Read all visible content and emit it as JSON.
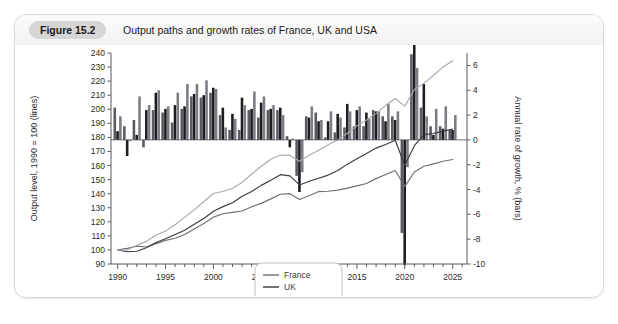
{
  "figure": {
    "badge": "Figure 15.2",
    "caption": "Output paths and growth rates of France, UK and USA"
  },
  "axes": {
    "left_title": "Output level, 1990 = 100 (lines)",
    "right_title": "Annual rate of growth, % (bars)",
    "left_ticks": [
      90,
      100,
      110,
      120,
      130,
      140,
      150,
      160,
      170,
      180,
      190,
      200,
      210,
      220,
      230,
      240
    ],
    "right_ticks": [
      -10,
      -8,
      -6,
      -4,
      -2,
      0,
      2,
      4,
      6
    ],
    "x_ticks": [
      1990,
      1995,
      2000,
      2005,
      2010,
      2015,
      2020,
      2025
    ]
  },
  "legend": {
    "items": [
      {
        "label": "France",
        "color": "#6f6f76"
      },
      {
        "label": "UK",
        "color": "#3a3a42"
      },
      {
        "label": "USA",
        "color": "#a9a9b0"
      }
    ]
  },
  "chart_data": {
    "type": "line",
    "title": "Output paths and growth rates of France, UK and USA",
    "xlabel": "",
    "ylabel": "Output level, 1990 = 100 (lines)",
    "y2label": "Annual rate of growth, % (bars)",
    "ylim": [
      90,
      240
    ],
    "y2lim": [
      -10,
      7
    ],
    "xlim": [
      1989.3,
      2026.5
    ],
    "grid": false,
    "legend_position": "inside-bottom-center",
    "x": [
      1990,
      1991,
      1992,
      1993,
      1994,
      1995,
      1996,
      1997,
      1998,
      1999,
      2000,
      2001,
      2002,
      2003,
      2004,
      2005,
      2006,
      2007,
      2008,
      2009,
      2010,
      2011,
      2012,
      2013,
      2014,
      2015,
      2016,
      2017,
      2018,
      2019,
      2020,
      2021,
      2022,
      2023,
      2024,
      2025
    ],
    "series": [
      {
        "name": "France",
        "kind": "line",
        "color": "#6f6f76",
        "axis": "left",
        "values": [
          100,
          101.1,
          102.7,
          102.1,
          104.5,
          106.8,
          108.3,
          111.0,
          114.9,
          118.8,
          123.3,
          125.7,
          126.7,
          127.7,
          130.7,
          133.1,
          136.3,
          139.6,
          140.0,
          135.9,
          138.5,
          141.5,
          141.7,
          142.5,
          143.9,
          145.5,
          147.2,
          150.7,
          153.6,
          156.5,
          145.2,
          155.4,
          159.5,
          161.2,
          163.0,
          164.3
        ]
      },
      {
        "name": "UK",
        "kind": "line",
        "color": "#3a3a42",
        "axis": "left",
        "values": [
          100,
          98.7,
          99.1,
          101.5,
          105.3,
          108.0,
          111.0,
          114.0,
          118.2,
          122.4,
          127.5,
          130.8,
          133.6,
          138.1,
          141.6,
          145.9,
          149.6,
          153.5,
          152.6,
          146.2,
          148.8,
          151.0,
          153.2,
          156.4,
          161.0,
          164.9,
          168.6,
          172.4,
          175.0,
          178.0,
          160.2,
          174.1,
          182.0,
          182.8,
          184.5,
          186.0
        ]
      },
      {
        "name": "USA",
        "kind": "line",
        "color": "#a9a9b0",
        "axis": "left",
        "values": [
          100,
          99.9,
          103.4,
          106.1,
          110.4,
          113.5,
          117.9,
          123.3,
          128.5,
          134.4,
          140.1,
          141.5,
          143.9,
          148.0,
          154.0,
          159.5,
          164.4,
          167.5,
          167.2,
          163.0,
          167.3,
          170.9,
          174.8,
          178.3,
          183.0,
          188.2,
          192.4,
          196.9,
          202.8,
          207.7,
          202.2,
          214.0,
          218.4,
          224.2,
          230.0,
          234.5
        ],
        "endpoint_level": 234
      },
      {
        "name": "France",
        "kind": "bar",
        "color": "#5a5a62",
        "axis": "right",
        "values": [
          2.6,
          1.1,
          1.6,
          -0.6,
          2.4,
          2.2,
          1.4,
          2.5,
          3.5,
          3.4,
          3.8,
          2.0,
          0.8,
          0.8,
          2.4,
          1.8,
          2.4,
          2.4,
          0.3,
          -2.9,
          1.9,
          2.2,
          0.2,
          0.6,
          1.0,
          1.1,
          1.1,
          2.4,
          1.9,
          1.9,
          -7.5,
          6.9,
          2.6,
          1.1,
          1.1,
          0.8
        ]
      },
      {
        "name": "UK",
        "kind": "bar",
        "color": "#1c1c22",
        "axis": "right",
        "values": [
          0.7,
          -1.3,
          0.4,
          2.4,
          3.8,
          2.5,
          2.8,
          2.7,
          3.7,
          3.6,
          4.2,
          2.6,
          2.1,
          3.4,
          2.5,
          3.0,
          2.5,
          2.6,
          -0.6,
          -4.2,
          1.8,
          1.5,
          1.5,
          2.1,
          2.9,
          2.4,
          2.2,
          2.3,
          1.5,
          1.6,
          -10.1,
          8.7,
          4.5,
          0.4,
          0.9,
          0.8
        ]
      },
      {
        "name": "USA",
        "kind": "bar",
        "color": "#7c7c84",
        "axis": "right",
        "values": [
          1.9,
          -0.1,
          3.5,
          2.8,
          4.0,
          2.7,
          3.8,
          4.5,
          4.5,
          4.8,
          4.1,
          1.0,
          1.7,
          2.8,
          3.9,
          3.5,
          2.8,
          2.0,
          0.1,
          -2.6,
          2.7,
          1.6,
          2.3,
          1.8,
          2.3,
          2.7,
          1.7,
          2.3,
          2.9,
          2.3,
          -2.2,
          5.8,
          1.9,
          2.5,
          2.7,
          2.0
        ]
      }
    ]
  }
}
